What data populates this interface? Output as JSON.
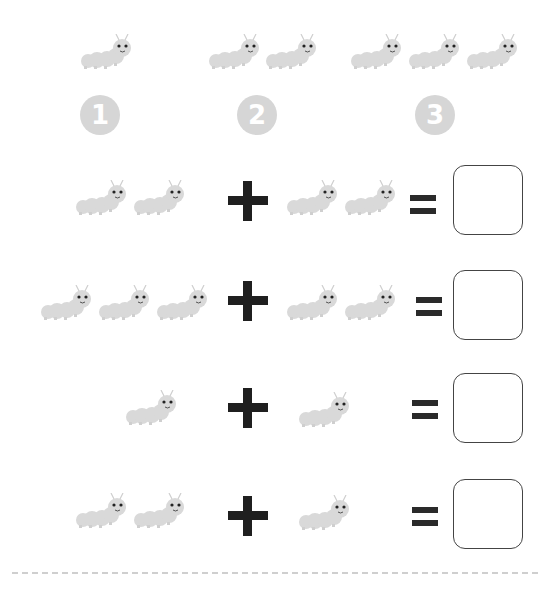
{
  "worksheet": {
    "legend": [
      {
        "number": "1",
        "count": 1
      },
      {
        "number": "2",
        "count": 2
      },
      {
        "number": "3",
        "count": 3
      }
    ],
    "problems": [
      {
        "left_count": 2,
        "operator": "+",
        "right_count": 2,
        "equals": "=",
        "answer": ""
      },
      {
        "left_count": 3,
        "operator": "+",
        "right_count": 2,
        "equals": "=",
        "answer": ""
      },
      {
        "left_count": 1,
        "operator": "+",
        "right_count": 1,
        "equals": "=",
        "answer": ""
      },
      {
        "left_count": 2,
        "operator": "+",
        "right_count": 1,
        "equals": "=",
        "answer": ""
      }
    ],
    "colors": {
      "caterpillar": "#d8d8d8",
      "symbol": "#1f1f1f",
      "box_border": "#444444"
    }
  }
}
